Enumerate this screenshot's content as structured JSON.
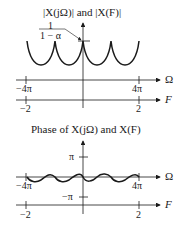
{
  "top_plot": {
    "title": "|X(jΩ)| and |X(F)|",
    "peak_label_num": "1",
    "peak_label_den": "1 − α",
    "omega_axis_label": "Ω",
    "f_axis_label": "F",
    "omega_ticks": [
      "−4π",
      "4π"
    ],
    "f_ticks": [
      "−2",
      "2"
    ]
  },
  "bottom_plot": {
    "title": "Phase of X(jΩ) and X(F)",
    "y_ticks": [
      "π",
      "−π"
    ],
    "omega_axis_label": "Ω",
    "f_axis_label": "F",
    "omega_ticks": [
      "−4π",
      "4π"
    ],
    "f_ticks": [
      "−2",
      "2"
    ]
  },
  "colors": {
    "line": "#1a1a1a",
    "background": "#ffffff"
  }
}
